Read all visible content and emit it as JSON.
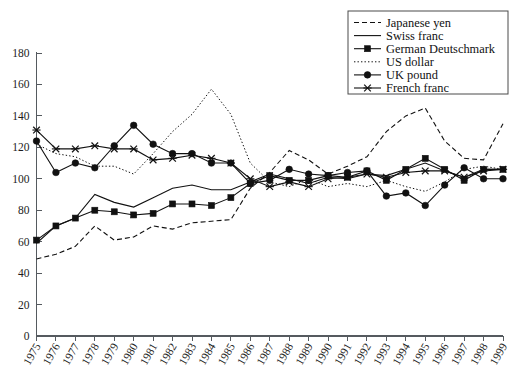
{
  "chart_data": {
    "type": "line",
    "title": "",
    "subtitle": "",
    "xlabel": "",
    "ylabel": "",
    "xlim": [
      1975,
      1999
    ],
    "ylim": [
      0,
      180
    ],
    "y_ticks": [
      0,
      20,
      40,
      60,
      80,
      100,
      120,
      140,
      160,
      180
    ],
    "grid": false,
    "legend_position": "top-right",
    "x": [
      1975,
      1976,
      1977,
      1978,
      1979,
      1980,
      1981,
      1982,
      1983,
      1984,
      1985,
      1986,
      1987,
      1988,
      1989,
      1990,
      1991,
      1992,
      1993,
      1994,
      1995,
      1996,
      1997,
      1998,
      1999
    ],
    "categories": [
      "1975",
      "1976",
      "1977",
      "1978",
      "1979",
      "1980",
      "1981",
      "1982",
      "1983",
      "1984",
      "1985",
      "1986",
      "1987",
      "1988",
      "1989",
      "1990",
      "1991",
      "1992",
      "1993",
      "1994",
      "1995",
      "1996",
      "1997",
      "1998",
      "1999"
    ],
    "series": [
      {
        "name": "Japanese yen",
        "style": "dashed",
        "marker": "none",
        "values": [
          49,
          52,
          57,
          70,
          61,
          63,
          70,
          68,
          72,
          73,
          74,
          94,
          104,
          118,
          112,
          103,
          108,
          114,
          130,
          140,
          145,
          124,
          113,
          112,
          135
        ]
      },
      {
        "name": "Swiss franc",
        "style": "solid",
        "marker": "none",
        "values": [
          59,
          70,
          75,
          90,
          85,
          82,
          88,
          94,
          96,
          93,
          93,
          98,
          103,
          100,
          97,
          101,
          100,
          103,
          102,
          106,
          110,
          105,
          101,
          106,
          106
        ]
      },
      {
        "name": "German Deutschmark",
        "style": "solid",
        "marker": "square",
        "values": [
          61,
          70,
          75,
          80,
          79,
          77,
          78,
          84,
          84,
          83,
          88,
          97,
          102,
          99,
          99,
          102,
          101,
          105,
          99,
          106,
          113,
          106,
          99,
          106,
          106
        ]
      },
      {
        "name": "US dollar",
        "style": "dotted",
        "marker": "none",
        "values": [
          122,
          116,
          114,
          108,
          108,
          103,
          116,
          130,
          141,
          157,
          141,
          110,
          98,
          95,
          100,
          95,
          97,
          95,
          99,
          95,
          92,
          98,
          106,
          108,
          106
        ]
      },
      {
        "name": "UK pound",
        "style": "solid",
        "marker": "circle",
        "values": [
          124,
          104,
          110,
          107,
          121,
          134,
          122,
          116,
          116,
          110,
          110,
          97,
          99,
          106,
          103,
          102,
          104,
          105,
          89,
          91,
          83,
          96,
          107,
          100,
          100
        ]
      },
      {
        "name": "French franc",
        "style": "solid",
        "marker": "cross",
        "values": [
          131,
          119,
          119,
          121,
          119,
          119,
          112,
          113,
          115,
          113,
          110,
          100,
          95,
          98,
          95,
          100,
          101,
          103,
          101,
          104,
          105,
          105,
          101,
          105,
          106
        ]
      }
    ]
  },
  "legend": {
    "entries": [
      {
        "label": "Japanese yen"
      },
      {
        "label": "Swiss franc"
      },
      {
        "label": "German Deutschmark"
      },
      {
        "label": "US dollar"
      },
      {
        "label": "UK pound"
      },
      {
        "label": "French franc"
      }
    ]
  }
}
